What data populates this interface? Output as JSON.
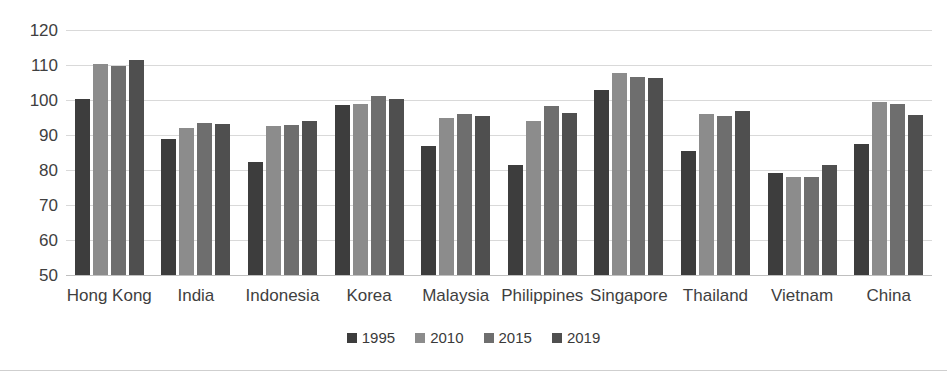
{
  "chart_data": {
    "type": "bar",
    "title": "",
    "subtitle": "",
    "xlabel": "",
    "ylabel": "",
    "ylim": [
      50,
      120
    ],
    "ytick_step": 10,
    "yticks": [
      120,
      110,
      100,
      90,
      80,
      70,
      60,
      50
    ],
    "grid": true,
    "legend_position": "bottom",
    "categories": [
      "Hong Kong",
      "India",
      "Indonesia",
      "Korea",
      "Malaysia",
      "Philippines",
      "Singapore",
      "Thailand",
      "Vietnam",
      "China"
    ],
    "series": [
      {
        "name": "1995",
        "color": "#3d3d3d",
        "values": [
          100.3,
          89.0,
          82.4,
          98.6,
          86.8,
          81.5,
          103.0,
          85.3,
          79.2,
          87.4
        ]
      },
      {
        "name": "2010",
        "color": "#8c8c8c",
        "values": [
          110.2,
          92.0,
          92.6,
          99.0,
          94.8,
          94.0,
          107.8,
          96.1,
          78.0,
          99.3
        ]
      },
      {
        "name": "2015",
        "color": "#6e6e6e",
        "values": [
          109.7,
          93.4,
          93.0,
          101.2,
          96.0,
          98.3,
          106.5,
          95.3,
          78.0,
          99.0
        ]
      },
      {
        "name": "2019",
        "color": "#4f4f4f",
        "values": [
          111.5,
          93.1,
          94.0,
          100.3,
          95.3,
          96.4,
          106.3,
          97.0,
          81.5,
          95.8
        ]
      }
    ]
  },
  "legend": {
    "items": [
      {
        "label": "1995",
        "color": "#3d3d3d"
      },
      {
        "label": "2010",
        "color": "#8c8c8c"
      },
      {
        "label": "2015",
        "color": "#6e6e6e"
      },
      {
        "label": "2019",
        "color": "#4f4f4f"
      }
    ]
  }
}
